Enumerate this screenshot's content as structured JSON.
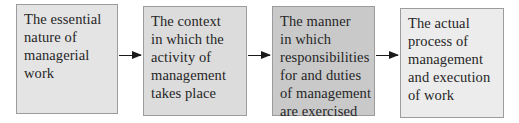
{
  "diagram": {
    "type": "flow",
    "direction": "left-to-right",
    "colors": {
      "border": "#9c9c9c",
      "text": "#262626",
      "arrow": "#1a1a1a"
    },
    "boxes": [
      {
        "id": "box-1",
        "fill": "#e4e4e4",
        "lines": [
          "The essential",
          "nature of",
          "managerial",
          "work"
        ]
      },
      {
        "id": "box-2",
        "fill": "#dcdcdc",
        "lines": [
          "The context",
          "in which the",
          "activity of",
          "management",
          "takes place"
        ]
      },
      {
        "id": "box-3",
        "fill": "#c9c9c9",
        "lines": [
          "The manner",
          "in which",
          "responsibilities",
          "for and duties",
          "of management",
          "are exercised"
        ]
      },
      {
        "id": "box-4",
        "fill": "#ececec",
        "lines": [
          "The actual",
          "process of",
          "management",
          "and execution",
          "of work"
        ]
      }
    ],
    "arrows": [
      {
        "from": "box-1",
        "to": "box-2"
      },
      {
        "from": "box-2",
        "to": "box-3"
      },
      {
        "from": "box-3",
        "to": "box-4"
      }
    ]
  }
}
